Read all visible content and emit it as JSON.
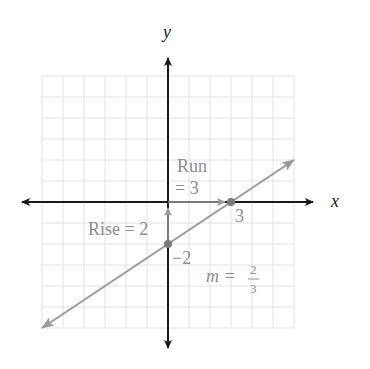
{
  "chart_data": {
    "type": "line",
    "title": "",
    "xlabel": "x",
    "ylabel": "y",
    "grid": true,
    "xlim": [
      -6,
      6
    ],
    "ylim": [
      -6,
      6
    ],
    "series": [
      {
        "name": "line",
        "equation": "y = (2/3)x - 2",
        "slope": "2/3",
        "y_intercept": -2,
        "x_intercept": 3,
        "points": [
          {
            "x": 0,
            "y": -2
          },
          {
            "x": 3,
            "y": 0
          }
        ]
      }
    ],
    "annotations": [
      {
        "text": "Run = 3"
      },
      {
        "text": "Rise = 2"
      },
      {
        "text": "m = 2/3"
      },
      {
        "text": "3",
        "at": {
          "x": 3,
          "y": 0
        }
      },
      {
        "text": "−2",
        "at": {
          "x": 0,
          "y": -2
        }
      }
    ]
  },
  "labels": {
    "x_axis": "x",
    "y_axis": "y",
    "run_line1": "Run",
    "run_line2": "= 3",
    "rise": "Rise = 2",
    "x_intercept": "3",
    "y_intercept": "−2",
    "slope_m": "m =",
    "slope_num": "2",
    "slope_den": "3"
  },
  "colors": {
    "axis": "#1a1a1a",
    "line": "#9a9a9a",
    "grid": "#e2e2e2",
    "label_gray": "#8c8c8c",
    "point": "#7a7a7a"
  }
}
